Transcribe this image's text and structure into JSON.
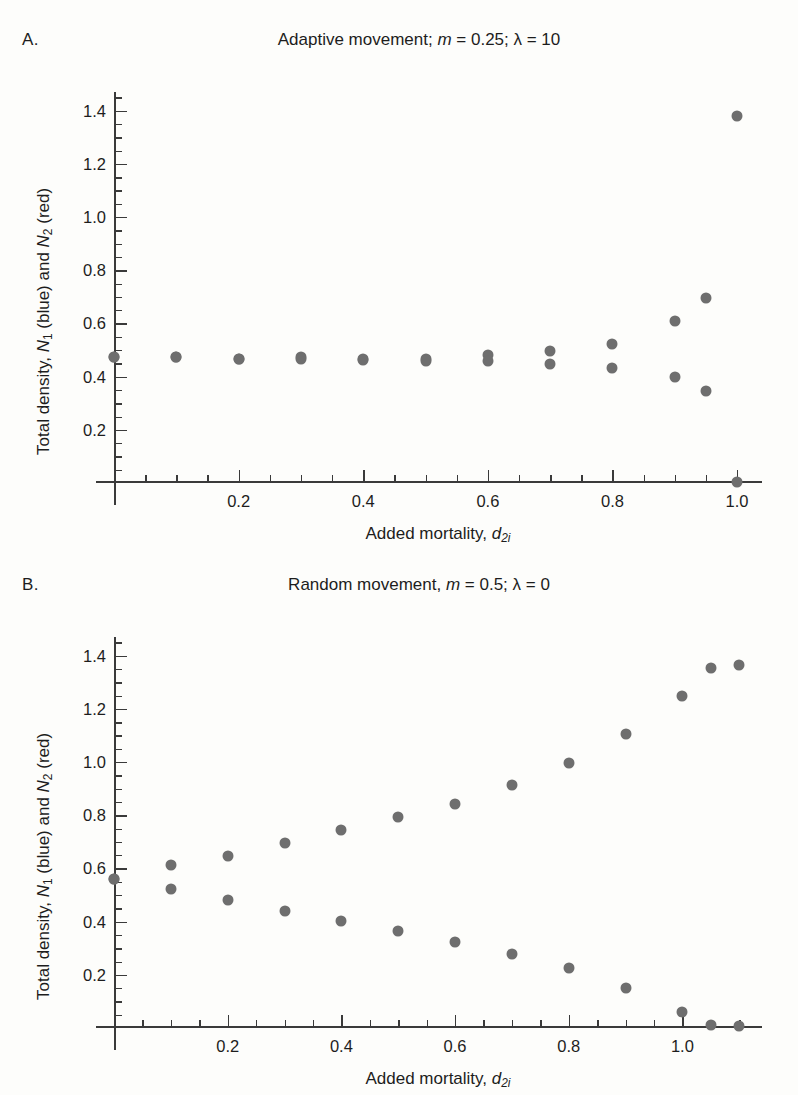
{
  "figure": {
    "background": "#fdfdfb",
    "marker_color": "#6e6e6e",
    "axis_color": "#3a3a3a"
  },
  "panels": [
    {
      "letter": "A.",
      "title_plain": "Adaptive movement; m = 0.25; λ = 10",
      "title_prefix": "Adaptive movement; ",
      "title_m_var": "m",
      "title_m_val": " = 0.25; ",
      "title_lambda": "λ",
      "title_lambda_val": " = 10"
    },
    {
      "letter": "B.",
      "title_plain": "Random movement, m = 0.5; λ = 0",
      "title_prefix": "Random movement, ",
      "title_m_var": "m",
      "title_m_val": " = 0.5; ",
      "title_lambda": "λ",
      "title_lambda_val": " = 0"
    }
  ],
  "axes": {
    "xlabel_prefix": "Added mortality, ",
    "xlabel_var": "d",
    "xlabel_sub": "2i",
    "ylabel_prefix": "Total density, ",
    "ylabel_n1": "N",
    "ylabel_n1_sub": "1",
    "ylabel_mid": " (blue) and ",
    "ylabel_n2": "N",
    "ylabel_n2_sub": "2",
    "ylabel_suffix": " (red)",
    "y_tick_labels": [
      "0.2",
      "0.4",
      "0.6",
      "0.8",
      "1.0",
      "1.2",
      "1.4"
    ],
    "x_tick_labels_a": [
      "0.2",
      "0.4",
      "0.6",
      "0.8",
      "1.0"
    ],
    "x_tick_labels_b": [
      "0.2",
      "0.4",
      "0.6",
      "0.8",
      "1.0"
    ]
  },
  "chart_data": [
    {
      "type": "scatter",
      "panel": "A",
      "title": "Adaptive movement; m = 0.25; λ = 10",
      "xlabel": "Added mortality, d2i",
      "ylabel": "Total density, N1 (blue) and N2 (red)",
      "xlim": [
        0,
        1.04
      ],
      "ylim": [
        0,
        1.47
      ],
      "xticks": [
        0.2,
        0.4,
        0.6,
        0.8,
        1.0
      ],
      "yticks": [
        0.2,
        0.4,
        0.6,
        0.8,
        1.0,
        1.2,
        1.4
      ],
      "minor_tick_step_x": 0.05,
      "minor_tick_step_y": 0.05,
      "grid": false,
      "legend": "none",
      "x": [
        0.0,
        0.1,
        0.2,
        0.3,
        0.4,
        0.5,
        0.6,
        0.7,
        0.8,
        0.9,
        0.95,
        1.0
      ],
      "series": [
        {
          "name": "N1 (blue)",
          "color": "#6e6e6e",
          "values": [
            0.475,
            0.472,
            0.468,
            0.472,
            0.468,
            0.468,
            0.482,
            0.497,
            0.523,
            0.608,
            0.697,
            1.381
          ]
        },
        {
          "name": "N2 (red)",
          "color": "#6e6e6e",
          "values": [
            0.475,
            0.472,
            0.468,
            0.468,
            0.462,
            0.458,
            0.458,
            0.447,
            0.432,
            0.398,
            0.346,
            0.005
          ]
        }
      ]
    },
    {
      "type": "scatter",
      "panel": "B",
      "title": "Random movement, m = 0.5; λ = 0",
      "xlabel": "Added mortality, d2i",
      "ylabel": "Total density, N1 (blue) and N2 (red)",
      "xlim": [
        0,
        1.14
      ],
      "ylim": [
        0,
        1.47
      ],
      "xticks": [
        0.2,
        0.4,
        0.6,
        0.8,
        1.0
      ],
      "yticks": [
        0.2,
        0.4,
        0.6,
        0.8,
        1.0,
        1.2,
        1.4
      ],
      "minor_tick_step_x": 0.05,
      "minor_tick_step_y": 0.05,
      "grid": false,
      "legend": "none",
      "x": [
        0.0,
        0.1,
        0.2,
        0.3,
        0.4,
        0.5,
        0.6,
        0.7,
        0.8,
        0.9,
        1.0,
        1.05,
        1.1
      ],
      "series": [
        {
          "name": "N1 (blue)",
          "color": "#6e6e6e",
          "values": [
            0.561,
            0.611,
            0.648,
            0.697,
            0.745,
            0.793,
            0.842,
            0.913,
            0.998,
            1.104,
            1.249,
            1.352,
            1.366
          ]
        },
        {
          "name": "N2 (red)",
          "color": "#6e6e6e",
          "values": [
            0.561,
            0.521,
            0.481,
            0.441,
            0.404,
            0.363,
            0.322,
            0.277,
            0.224,
            0.151,
            0.061,
            0.012,
            0.008
          ]
        }
      ]
    }
  ]
}
